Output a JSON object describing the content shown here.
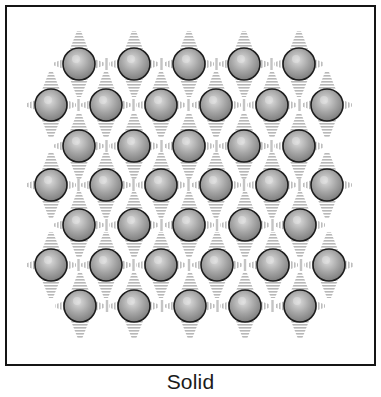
{
  "figure": {
    "caption": "Solid",
    "lattice": {
      "rows": [
        {
          "y": 64,
          "xs": [
            79,
            134,
            189,
            244,
            299
          ]
        },
        {
          "y": 105,
          "xs": [
            51,
            106,
            161,
            216,
            272,
            327
          ]
        },
        {
          "y": 146,
          "xs": [
            79,
            134,
            189,
            244,
            299
          ]
        },
        {
          "y": 185,
          "xs": [
            51,
            106,
            161,
            216,
            272,
            327
          ]
        },
        {
          "y": 225,
          "xs": [
            79,
            134,
            189,
            245,
            300
          ]
        },
        {
          "y": 265,
          "xs": [
            51,
            106,
            161,
            217,
            273,
            329
          ]
        },
        {
          "y": 306,
          "xs": [
            80,
            134,
            190,
            245,
            300
          ]
        }
      ],
      "particle_radius": 16,
      "particle_count": 38
    },
    "colors": {
      "particle_fill": "#a4a4a4",
      "particle_highlight": "#dcdcdc",
      "particle_shadow": "#7a7a7a",
      "particle_outline": "#1c1c1c",
      "bond": "#b8b8b8",
      "frame": "#151515"
    }
  }
}
